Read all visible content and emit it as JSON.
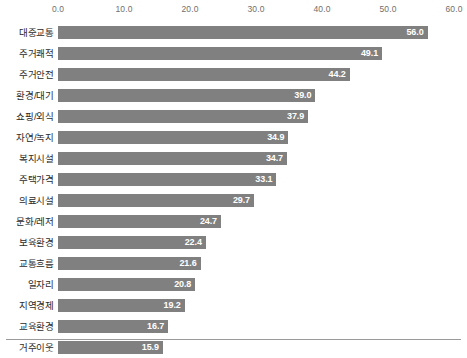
{
  "chart_data": {
    "type": "bar",
    "orientation": "horizontal",
    "title": "",
    "subtitle": "",
    "xlabel": "",
    "ylabel": "",
    "xlim": [
      0.0,
      60.0
    ],
    "xticks": [
      "0.0",
      "10.0",
      "20.0",
      "30.0",
      "40.0",
      "50.0",
      "60.0"
    ],
    "xtick_values": [
      0,
      10,
      20,
      30,
      40,
      50,
      60
    ],
    "grid": false,
    "legend": null,
    "bar_color": "#808080",
    "value_label_color": "#ffffff",
    "categories": [
      "대중교통",
      "주거쾌적",
      "주거안전",
      "환경/대기",
      "쇼핑/외식",
      "자연/녹지",
      "복지시설",
      "주택가격",
      "의료시설",
      "문화/레저",
      "보육환경",
      "교통흐름",
      "일자리",
      "지역경제",
      "교육환경",
      "거주이웃"
    ],
    "values": [
      56.0,
      49.1,
      44.2,
      39.0,
      37.9,
      34.9,
      34.7,
      33.1,
      29.7,
      24.7,
      22.4,
      21.6,
      20.8,
      19.2,
      16.7,
      15.9
    ],
    "value_labels": [
      "56.0",
      "49.1",
      "44.2",
      "39.0",
      "37.9",
      "34.9",
      "34.7",
      "33.1",
      "29.7",
      "24.7",
      "22.4",
      "21.6",
      "20.8",
      "19.2",
      "16.7",
      "15.9"
    ]
  }
}
